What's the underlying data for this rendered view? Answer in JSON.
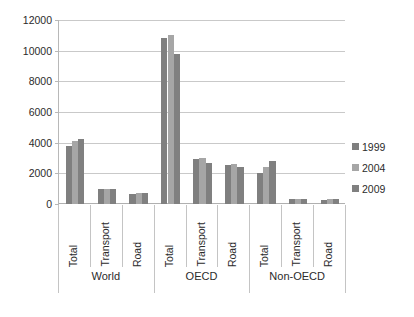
{
  "chart_data": {
    "type": "bar",
    "title": "",
    "subtitle": "",
    "xlabel": "",
    "ylabel": "",
    "ylim": [
      0,
      12000
    ],
    "ytick_labels": [
      "12000",
      "10000",
      "8000",
      "6000",
      "4000",
      "2000",
      "0"
    ],
    "ytick_values": [
      12000,
      10000,
      8000,
      6000,
      4000,
      2000,
      0
    ],
    "grid": true,
    "legend_position": "right",
    "group_labels": [
      "World",
      "OECD",
      "Non-OECD"
    ],
    "categories": [
      "Total",
      "Transport",
      "Road",
      "Total",
      "Transport",
      "Road",
      "Total",
      "Transport",
      "Road"
    ],
    "groups": [
      {
        "name": "World",
        "categories": [
          "Total",
          "Transport",
          "Road"
        ]
      },
      {
        "name": "OECD",
        "categories": [
          "Total",
          "Transport",
          "Road"
        ]
      },
      {
        "name": "Non-OECD",
        "categories": [
          "Total",
          "Transport",
          "Road"
        ]
      }
    ],
    "series": [
      {
        "name": "1999",
        "color": "#7f7f7f",
        "values": [
          3800,
          950,
          680,
          10800,
          2950,
          2560,
          2050,
          320,
          280
        ]
      },
      {
        "name": "2004",
        "color": "#a6a6a6",
        "values": [
          4100,
          980,
          700,
          11050,
          2980,
          2600,
          2400,
          340,
          300
        ]
      },
      {
        "name": "2009",
        "color": "#808080",
        "values": [
          4250,
          970,
          690,
          9800,
          2650,
          2400,
          2800,
          350,
          310
        ]
      }
    ]
  },
  "legend": {
    "entries": [
      {
        "label": "1999",
        "color": "#7f7f7f"
      },
      {
        "label": "2004",
        "color": "#a6a6a6"
      },
      {
        "label": "2009",
        "color": "#808080"
      }
    ]
  },
  "colors": {
    "series_1999": "#7f7f7f",
    "series_2004": "#a6a6a6",
    "series_2009": "#808080",
    "gridline": "#c9c9c9",
    "axis": "#b8b8b8",
    "text": "#2b2b2b",
    "background": "#ffffff"
  }
}
